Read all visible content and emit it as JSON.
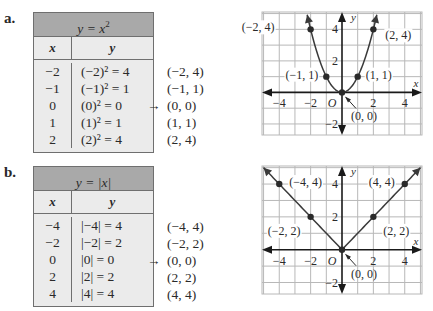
{
  "panels": [
    {
      "label": "a.",
      "table": {
        "title": "y = x",
        "title_exponent": "2",
        "col_x": "x",
        "col_y": "y",
        "rows": [
          {
            "x": "−2",
            "y": "(−2)² = 4"
          },
          {
            "x": "−1",
            "y": "(−1)² = 1"
          },
          {
            "x": "0",
            "y": "(0)² = 0"
          },
          {
            "x": "1",
            "y": "(1)² = 1"
          },
          {
            "x": "2",
            "y": "(2)² = 4"
          }
        ]
      },
      "pairs": [
        "(−2, 4)",
        "(−1, 1)",
        "(0, 0)",
        "(1, 1)",
        "(2, 4)"
      ],
      "arrow_symbol": "→",
      "arrow_row": 2
    },
    {
      "label": "b.",
      "table": {
        "title": "y = |x|",
        "title_exponent": "",
        "col_x": "x",
        "col_y": "y",
        "rows": [
          {
            "x": "−4",
            "y": "|−4| = 4"
          },
          {
            "x": "−2",
            "y": "|−2| = 2"
          },
          {
            "x": "0",
            "y": "|0| = 0"
          },
          {
            "x": "2",
            "y": "|2| = 2"
          },
          {
            "x": "4",
            "y": "|4| = 4"
          }
        ]
      },
      "pairs": [
        "(−4, 4)",
        "(−2, 2)",
        "(0, 0)",
        "(2, 2)",
        "(4, 4)"
      ],
      "arrow_symbol": "→",
      "arrow_row": 2
    }
  ],
  "chart_data": [
    {
      "type": "line",
      "title": "y = x²",
      "function": "square",
      "xlabel": "x",
      "ylabel": "y",
      "origin_label": "O",
      "xlim": [
        -5.1,
        5.1
      ],
      "ylim": [
        -2.7,
        5.1
      ],
      "grid": true,
      "x_ticks": [
        -4,
        -2,
        2,
        4
      ],
      "x_tick_labels": [
        "−4",
        "−2",
        "2",
        "4"
      ],
      "y_ticks": [
        4,
        2,
        -2
      ],
      "y_tick_labels": [
        "4",
        "2",
        "−2"
      ],
      "points": [
        {
          "x": -2,
          "y": 4,
          "label": "(−2, 4)"
        },
        {
          "x": -1,
          "y": 1,
          "label": "(−1, 1)"
        },
        {
          "x": 0,
          "y": 0,
          "label": "(0, 0)"
        },
        {
          "x": 1,
          "y": 1,
          "label": "(1, 1)"
        },
        {
          "x": 2,
          "y": 4,
          "label": "(2, 4)"
        }
      ],
      "colors": {
        "curve": "#3a3a3a",
        "grid": "#b8b8b8",
        "axis": "#1a1a1a"
      }
    },
    {
      "type": "line",
      "title": "y = |x|",
      "function": "abs",
      "xlabel": "x",
      "ylabel": "y",
      "origin_label": "O",
      "xlim": [
        -5.1,
        5.1
      ],
      "ylim": [
        -2.7,
        5.1
      ],
      "grid": true,
      "x_ticks": [
        -4,
        -2,
        2,
        4
      ],
      "x_tick_labels": [
        "−4",
        "−2",
        "2",
        "4"
      ],
      "y_ticks": [
        4,
        2,
        -2
      ],
      "y_tick_labels": [
        "4",
        "2",
        "−2"
      ],
      "points": [
        {
          "x": -4,
          "y": 4,
          "label": "(−4, 4)"
        },
        {
          "x": -2,
          "y": 2,
          "label": "(−2, 2)"
        },
        {
          "x": 0,
          "y": 0,
          "label": "(0, 0)"
        },
        {
          "x": 2,
          "y": 2,
          "label": "(2, 2)"
        },
        {
          "x": 4,
          "y": 4,
          "label": "(4, 4)"
        }
      ],
      "colors": {
        "curve": "#3a3a3a",
        "grid": "#b8b8b8",
        "axis": "#1a1a1a"
      }
    }
  ]
}
